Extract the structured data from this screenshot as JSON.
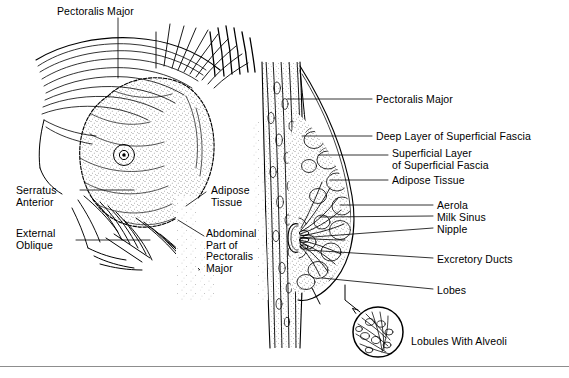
{
  "figure": {
    "background_color": "#ffffff",
    "ink_color": "#000000",
    "rule_color": "#8d8d8d",
    "width": 569,
    "height": 378
  },
  "panels": [
    {
      "id": "anterior-view",
      "name": "anterior-dissection-view",
      "description": "Anterior surface dissection of the chest wall and breast showing pectoralis major, serratus anterior and external oblique muscles with the breast mound"
    },
    {
      "id": "sagittal-view",
      "name": "sagittal-section-view",
      "description": "Sagittal section through the breast showing fascial layers, adipose tissue, lobes, ducts, milk sinus and nipple"
    },
    {
      "id": "lobule-inset",
      "name": "lobule-inset-circle",
      "description": "Circular magnified inset of a lobule with alveoli"
    }
  ],
  "labels": {
    "left": [
      {
        "key": "pectoralis-major-top",
        "text": "Pectoralis Major",
        "x": 57,
        "y": 6,
        "align": "left"
      },
      {
        "key": "serratus-anterior",
        "text": "Serratus\nAnterior",
        "x": 16,
        "y": 185,
        "align": "left"
      },
      {
        "key": "external-oblique",
        "text": "External\nOblique",
        "x": 16,
        "y": 228,
        "align": "left"
      },
      {
        "key": "adipose-tissue-left",
        "text": "Adipose\nTissue",
        "x": 211,
        "y": 185,
        "align": "left"
      },
      {
        "key": "abdominal-part-pectoralis",
        "text": "Abdominal\nPart of\nPectoralis\nMajor",
        "x": 206,
        "y": 228,
        "align": "left"
      }
    ],
    "right": [
      {
        "key": "pectoralis-major-right",
        "text": "Pectoralis Major",
        "x": 376,
        "y": 94,
        "align": "left"
      },
      {
        "key": "deep-layer-superficial-fascia",
        "text": "Deep Layer of Superficial Fascia",
        "x": 376,
        "y": 131,
        "align": "left"
      },
      {
        "key": "superficial-layer-superficial-fascia",
        "text": "Superficial Layer\nof Superficial Fascia",
        "x": 392,
        "y": 148,
        "align": "left"
      },
      {
        "key": "adipose-tissue-right",
        "text": "Adipose Tissue",
        "x": 392,
        "y": 175,
        "align": "left"
      },
      {
        "key": "aerola",
        "text": "Aerola",
        "x": 437,
        "y": 200,
        "align": "left"
      },
      {
        "key": "milk-sinus",
        "text": "Milk Sinus",
        "x": 437,
        "y": 212,
        "align": "left"
      },
      {
        "key": "nipple",
        "text": "Nipple",
        "x": 437,
        "y": 224,
        "align": "left"
      },
      {
        "key": "excretory-ducts",
        "text": "Excretory Ducts",
        "x": 437,
        "y": 254,
        "align": "left"
      },
      {
        "key": "lobes",
        "text": "Lobes",
        "x": 437,
        "y": 285,
        "align": "left"
      },
      {
        "key": "lobules-with-alveoli",
        "text": "Lobules With Alveoli",
        "x": 411,
        "y": 336,
        "align": "left"
      }
    ]
  }
}
